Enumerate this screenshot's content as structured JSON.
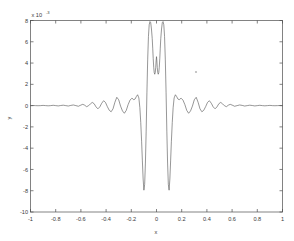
{
  "figure": {
    "background_color": "#ffffff",
    "axes_color": "#4d4d4d",
    "line_color": "#565656",
    "exponent_base": "x 10",
    "exponent_power": "-3",
    "artifact_label": "speck"
  },
  "chart_data": {
    "type": "line",
    "title": "",
    "subtitle": "",
    "xlabel": "x",
    "ylabel": "y",
    "y_multiplier": "x 10^-3",
    "xlim": [
      -1,
      1
    ],
    "ylim": [
      -10,
      8
    ],
    "grid": false,
    "legend": null,
    "xticks": [
      -1,
      -0.8,
      -0.6,
      -0.4,
      -0.2,
      0,
      0.2,
      0.4,
      0.6,
      0.8,
      1
    ],
    "xticklabels": [
      "-1",
      "-0.8",
      "-0.6",
      "-0.4",
      "-0.2",
      "0",
      "0.2",
      "0.4",
      "0.6",
      "0.8",
      "1"
    ],
    "yticks": [
      8,
      6,
      4,
      2,
      0,
      -2,
      -4,
      -6,
      -8,
      -10
    ],
    "yticklabels": [
      "8",
      "6",
      "4",
      "2",
      "0",
      "-2",
      "-4",
      "-6",
      "-8",
      "-10"
    ],
    "series": [
      {
        "name": "waveform",
        "description": "symmetric oscillatory wavelet with twin central peaks near +7.9e-3 at x=-0.03 and x=+0.03, deep troughs near -8.0e-3 at x=-0.10 and x=+0.10, and decaying side lobes",
        "x": [
          -1.0,
          -0.98,
          -0.96,
          -0.94,
          -0.92,
          -0.9,
          -0.88,
          -0.86,
          -0.84,
          -0.82,
          -0.8,
          -0.78,
          -0.76,
          -0.74,
          -0.72,
          -0.7,
          -0.68,
          -0.66,
          -0.64,
          -0.62,
          -0.6,
          -0.585,
          -0.57,
          -0.555,
          -0.54,
          -0.525,
          -0.51,
          -0.495,
          -0.48,
          -0.465,
          -0.45,
          -0.435,
          -0.42,
          -0.405,
          -0.39,
          -0.375,
          -0.36,
          -0.345,
          -0.33,
          -0.315,
          -0.3,
          -0.285,
          -0.27,
          -0.255,
          -0.24,
          -0.225,
          -0.21,
          -0.195,
          -0.18,
          -0.17,
          -0.16,
          -0.15,
          -0.14,
          -0.132,
          -0.125,
          -0.118,
          -0.112,
          -0.106,
          -0.1,
          -0.094,
          -0.088,
          -0.082,
          -0.076,
          -0.07,
          -0.064,
          -0.058,
          -0.052,
          -0.046,
          -0.04,
          -0.034,
          -0.03,
          -0.026,
          -0.022,
          -0.018,
          -0.014,
          -0.01,
          -0.006,
          -0.003,
          0.0,
          0.003,
          0.006,
          0.01,
          0.014,
          0.018,
          0.022,
          0.026,
          0.03,
          0.034,
          0.04,
          0.046,
          0.052,
          0.058,
          0.064,
          0.07,
          0.076,
          0.082,
          0.088,
          0.094,
          0.1,
          0.106,
          0.112,
          0.118,
          0.125,
          0.132,
          0.14,
          0.15,
          0.16,
          0.17,
          0.18,
          0.195,
          0.21,
          0.225,
          0.24,
          0.255,
          0.27,
          0.285,
          0.3,
          0.315,
          0.33,
          0.345,
          0.36,
          0.375,
          0.39,
          0.405,
          0.42,
          0.435,
          0.45,
          0.465,
          0.48,
          0.495,
          0.51,
          0.525,
          0.54,
          0.555,
          0.57,
          0.585,
          0.6,
          0.62,
          0.64,
          0.66,
          0.68,
          0.7,
          0.72,
          0.74,
          0.76,
          0.78,
          0.8,
          0.82,
          0.84,
          0.86,
          0.88,
          0.9,
          0.92,
          0.94,
          0.96,
          0.98,
          1.0
        ],
        "y": [
          0.0,
          0.01,
          0.0,
          -0.01,
          0.0,
          0.02,
          0.0,
          -0.02,
          0.0,
          0.03,
          0.0,
          -0.03,
          0.01,
          0.04,
          0.0,
          -0.04,
          0.02,
          0.06,
          0.0,
          -0.06,
          0.05,
          0.12,
          0.04,
          -0.1,
          -0.02,
          0.16,
          0.3,
          0.18,
          -0.12,
          -0.3,
          -0.12,
          0.22,
          0.46,
          0.3,
          -0.1,
          -0.44,
          -0.58,
          -0.3,
          0.32,
          0.78,
          0.55,
          -0.05,
          -0.5,
          -0.72,
          -0.45,
          0.1,
          0.52,
          0.7,
          0.55,
          0.62,
          0.85,
          1.02,
          0.72,
          -0.2,
          -1.6,
          -3.4,
          -5.2,
          -6.9,
          -7.95,
          -7.4,
          -5.4,
          -2.4,
          1.2,
          4.3,
          6.5,
          7.6,
          7.9,
          7.8,
          7.2,
          6.3,
          5.4,
          4.4,
          3.6,
          3.1,
          2.95,
          3.1,
          3.6,
          4.2,
          4.6,
          4.2,
          3.6,
          3.1,
          2.95,
          3.1,
          3.6,
          4.4,
          5.4,
          6.3,
          7.2,
          7.8,
          7.9,
          7.6,
          6.5,
          4.3,
          1.2,
          -2.4,
          -5.4,
          -7.4,
          -7.95,
          -6.9,
          -5.2,
          -3.4,
          -1.6,
          -0.2,
          0.72,
          1.02,
          0.85,
          0.62,
          0.55,
          0.7,
          0.52,
          0.1,
          -0.45,
          -0.72,
          -0.5,
          -0.05,
          0.55,
          0.78,
          0.32,
          -0.3,
          -0.58,
          -0.44,
          -0.1,
          0.3,
          0.46,
          0.22,
          -0.12,
          -0.3,
          -0.12,
          0.18,
          0.3,
          0.16,
          -0.02,
          -0.1,
          0.04,
          0.12,
          0.05,
          -0.06,
          0.0,
          0.06,
          0.02,
          -0.04,
          0.0,
          0.04,
          0.01,
          -0.03,
          0.0,
          0.03,
          0.0,
          -0.02,
          0.0,
          0.02,
          0.0,
          -0.01,
          0.0,
          0.01,
          0.0
        ]
      }
    ]
  }
}
